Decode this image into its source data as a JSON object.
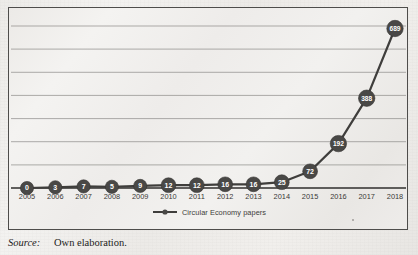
{
  "figure": {
    "panel_border_color": "#4e4d4b",
    "caption": {
      "label": "Source:",
      "text": "Own elaboration."
    }
  },
  "chart_data": {
    "type": "line",
    "title": "",
    "xlabel": "",
    "ylabel": "",
    "grid": true,
    "gridlines": 7,
    "ylim": [
      0,
      700
    ],
    "ytick_step": 100,
    "y_axis_labels_visible": false,
    "legend_position": "bottom-center",
    "marker_shape": "circle",
    "marker_fill": "#494846",
    "marker_text_color": "#ffffff",
    "line_color": "#3f3e3c",
    "show_data_labels": true,
    "categories": [
      "2005",
      "2006",
      "2007",
      "2008",
      "2009",
      "2010",
      "2011",
      "2012",
      "2013",
      "2014",
      "2015",
      "2016",
      "2017",
      "2018"
    ],
    "series": [
      {
        "name": "Circular Economy papers",
        "values": [
          0,
          3,
          7,
          5,
          9,
          12,
          12,
          16,
          16,
          25,
          72,
          192,
          388,
          689
        ]
      }
    ]
  },
  "legend": {
    "items": [
      {
        "label": "Circular Economy papers",
        "color": "#3f3e3c"
      }
    ]
  }
}
